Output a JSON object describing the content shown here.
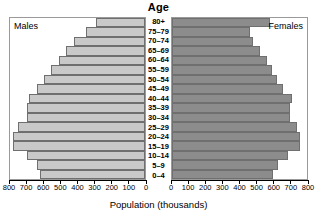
{
  "chart_data": {
    "type": "bar",
    "subtype": "population-pyramid",
    "title": "Age",
    "xlabel": "Population (thousands)",
    "ylabel": "Age",
    "grid": false,
    "legend_position": "in-panel-corners",
    "categories": [
      "80+",
      "75–79",
      "70–74",
      "65–69",
      "60–64",
      "55–59",
      "50–54",
      "45–49",
      "40–44",
      "35–39",
      "30–34",
      "25–29",
      "20–24",
      "15–19",
      "10–14",
      "5–9",
      "0–4"
    ],
    "series": [
      {
        "name": "Males",
        "color": "#c9c9c9",
        "axis": "left",
        "direction": "left",
        "values": [
          290,
          350,
          420,
          470,
          510,
          560,
          600,
          640,
          690,
          700,
          700,
          750,
          780,
          780,
          700,
          640,
          620
        ]
      },
      {
        "name": "Females",
        "color": "#8c8c8c",
        "axis": "right",
        "direction": "right",
        "values": [
          580,
          460,
          480,
          520,
          560,
          590,
          620,
          660,
          710,
          700,
          700,
          740,
          760,
          760,
          690,
          630,
          600
        ]
      }
    ],
    "xlim_left": [
      800,
      0
    ],
    "xlim_right": [
      0,
      800
    ],
    "left_ticks": [
      800,
      700,
      600,
      500,
      400,
      300,
      200,
      100,
      0
    ],
    "right_ticks": [
      0,
      100,
      200,
      300,
      400,
      500,
      600,
      700,
      800
    ],
    "axis_max": 800
  },
  "labels": {
    "males_tag": "Males",
    "females_tag": "Females"
  },
  "colors": {
    "male_bar": "#c9c9c9",
    "female_bar": "#8c8c8c",
    "bar_border": "#6f6f6f",
    "panel_border": "#9a9a9a",
    "axis": "#000000",
    "background": "#ffffff"
  }
}
